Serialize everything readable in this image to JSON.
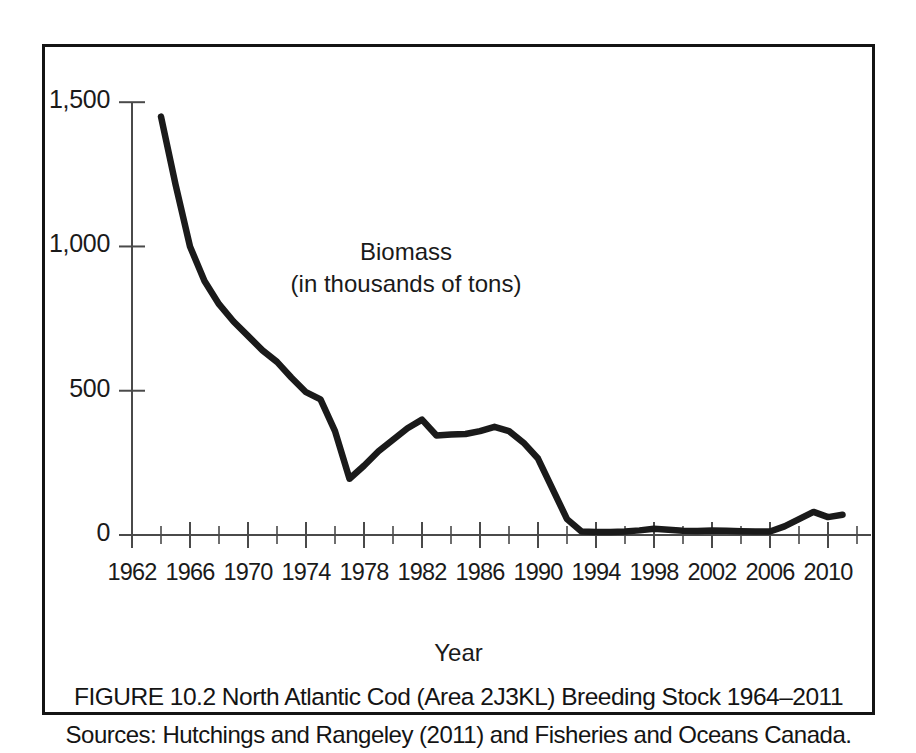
{
  "figure": {
    "caption_title": "FIGURE 10.2 North Atlantic Cod (Area 2J3KL) Breeding Stock 1964–2011",
    "caption_sources": "Sources: Hutchings and Rangeley (2011) and Fisheries and Oceans Canada.",
    "line_color": "#1a1a1a",
    "axis_color": "#4a4a4a",
    "border_color": "#141414",
    "background_color": "#ffffff"
  },
  "chart_data": {
    "type": "line",
    "title": "",
    "annotation_line1": "Biomass",
    "annotation_line2": "(in thousands of tons)",
    "xlabel": "Year",
    "ylabel": "",
    "xlim": [
      1962,
      2012
    ],
    "ylim": [
      0,
      1570
    ],
    "grid": false,
    "legend": false,
    "xticks": [
      1962,
      1966,
      1970,
      1974,
      1978,
      1982,
      1986,
      1990,
      1994,
      1998,
      2002,
      2006,
      2010
    ],
    "xtick_labels": [
      "1962",
      "1966",
      "1970",
      "1974",
      "1978",
      "1982",
      "1986",
      "1990",
      "1994",
      "1998",
      "2002",
      "2006",
      "2010"
    ],
    "xtick_minor": [
      1964,
      1968,
      1972,
      1976,
      1980,
      1984,
      1988,
      1992,
      1996,
      2000,
      2004,
      2008,
      2012
    ],
    "yticks": [
      0,
      500,
      1000,
      1500
    ],
    "ytick_labels": [
      "0",
      "500",
      "1,000",
      "1,500"
    ],
    "series": [
      {
        "name": "Biomass (in thousands of tons)",
        "x": [
          1964,
          1965,
          1966,
          1967,
          1968,
          1969,
          1970,
          1971,
          1972,
          1973,
          1974,
          1975,
          1976,
          1977,
          1978,
          1979,
          1980,
          1981,
          1982,
          1983,
          1984,
          1985,
          1986,
          1987,
          1988,
          1989,
          1990,
          1991,
          1992,
          1993,
          1994,
          1995,
          1996,
          1997,
          1998,
          1999,
          2000,
          2001,
          2002,
          2003,
          2004,
          2005,
          2006,
          2007,
          2008,
          2009,
          2010,
          2011
        ],
        "values": [
          1450,
          1215,
          1000,
          880,
          800,
          740,
          690,
          640,
          600,
          545,
          495,
          470,
          360,
          195,
          240,
          290,
          330,
          370,
          400,
          345,
          348,
          350,
          360,
          375,
          360,
          320,
          265,
          160,
          55,
          12,
          10,
          10,
          12,
          16,
          22,
          18,
          15,
          14,
          16,
          15,
          13,
          12,
          12,
          30,
          55,
          80,
          62,
          70
        ]
      }
    ]
  }
}
